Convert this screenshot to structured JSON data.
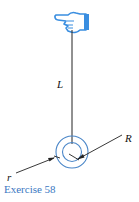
{
  "diagram": {
    "labels": {
      "length": "L",
      "outer_radius": "R",
      "inner_radius": "r"
    },
    "caption": "Exercise 58",
    "colors": {
      "hand": "#3a8ee0",
      "circles": "#4a86c8",
      "line": "#222222",
      "caption": "#3a78c2"
    }
  }
}
